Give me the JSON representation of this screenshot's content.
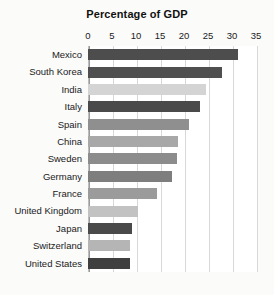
{
  "chart_data": {
    "type": "bar",
    "orientation": "horizontal",
    "title": "Percentage of GDP",
    "xlabel": "",
    "ylabel": "",
    "xlim": [
      0,
      35
    ],
    "xticks": [
      0,
      5,
      10,
      15,
      20,
      25,
      30,
      35
    ],
    "grid": true,
    "legend": null,
    "categories": [
      "Mexico",
      "South Korea",
      "India",
      "Italy",
      "Spain",
      "China",
      "Sweden",
      "Germany",
      "France",
      "United Kingdom",
      "Japan",
      "Switzerland",
      "United States"
    ],
    "values": [
      31.3,
      28.0,
      24.5,
      23.3,
      21.0,
      18.7,
      18.5,
      17.5,
      14.4,
      10.5,
      9.2,
      8.8,
      8.8
    ],
    "bar_colors": [
      "#4d4d4d",
      "#4f4f4f",
      "#d4d4d4",
      "#4a4a4a",
      "#8f8f8f",
      "#a8a8a8",
      "#8c8c8c",
      "#7e7e7e",
      "#9b9b9b",
      "#c2c2c2",
      "#4a4a4a",
      "#b5b5b5",
      "#3f3f3f"
    ]
  },
  "caption": ""
}
